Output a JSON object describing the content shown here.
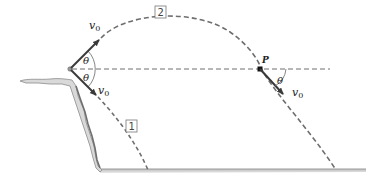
{
  "diagram": {
    "type": "projectile-motion-figure",
    "labels": {
      "velocity_upper": "v",
      "velocity_upper_sub": "0",
      "velocity_lower": "v",
      "velocity_lower_sub": "0",
      "velocity_at_p": "v",
      "velocity_at_p_sub": "0",
      "angle_upper": "θ",
      "angle_lower": "θ",
      "angle_at_p": "θ",
      "point_p": "P",
      "trajectory_1": "1",
      "trajectory_2": "2"
    },
    "colors": {
      "arrow": "#4a4a4a",
      "dashed": "#6e6e6e",
      "ground": "#a8a8a8",
      "cliff": "#8c8c8c",
      "text": "#222222"
    }
  }
}
